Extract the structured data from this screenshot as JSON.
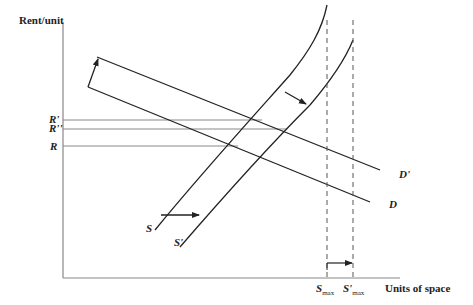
{
  "diagram": {
    "y_axis_label": "Rent/unit",
    "x_axis_label": "Units of space",
    "rent_levels": [
      {
        "label": "R'",
        "y": 120
      },
      {
        "label": "R''",
        "y": 129
      },
      {
        "label": "R",
        "y": 146
      }
    ],
    "demand_curves": [
      {
        "label": "D'",
        "description": "shifted demand"
      },
      {
        "label": "D",
        "description": "original demand"
      }
    ],
    "supply_curves": [
      {
        "label": "S",
        "description": "original supply"
      },
      {
        "label": "S'",
        "description": "shifted supply"
      }
    ],
    "capacity_markers": [
      {
        "label": "S",
        "sub": "max"
      },
      {
        "label": "S'",
        "sub": "max"
      }
    ],
    "colors": {
      "line": "#222222",
      "gridline": "#888888",
      "dashed": "#555555"
    }
  }
}
